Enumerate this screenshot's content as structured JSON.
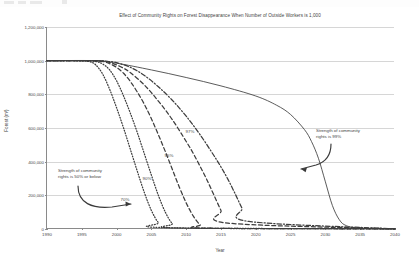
{
  "chart_data": {
    "type": "line",
    "title": "Effect of Community Rights on Forest Disappearance When Number of Outside Workers is 1,000",
    "xlabel": "Year",
    "ylabel": "Forest (m³)",
    "xlim": [
      1990,
      2040
    ],
    "ylim": [
      0,
      1200000
    ],
    "xticks": [
      1990,
      1995,
      2000,
      2005,
      2010,
      2015,
      2020,
      2025,
      2030,
      2035,
      2040
    ],
    "xtick_labels": [
      "1990",
      "1995",
      "2000",
      "2005",
      "2010",
      "2015",
      "2020",
      "2025",
      "2030",
      "2035",
      "2040"
    ],
    "yticks": [
      0,
      200000,
      400000,
      600000,
      800000,
      1000000,
      1200000
    ],
    "ytick_labels": [
      "0",
      "200,000",
      "400,000",
      "600,000",
      "800,000",
      "1,000,000",
      "1,200,000"
    ],
    "grid": true,
    "legend_position": "none",
    "line_color": "#3d3d3d",
    "grid_color": "#d6d6d6",
    "axis_color": "#8a8a8a",
    "series": [
      {
        "name": "50% or below",
        "label": "",
        "style": "dotted",
        "x": [
          1990,
          1994,
          1996,
          1997,
          1998,
          1999,
          2000,
          2001,
          2002,
          2003,
          2004,
          2005,
          2006,
          2007,
          2040
        ],
        "values": [
          1000000,
          1000000,
          995000,
          975000,
          920000,
          830000,
          720000,
          600000,
          470000,
          340000,
          215000,
          110000,
          38000,
          8000,
          1000
        ]
      },
      {
        "name": "70%",
        "label": "70%",
        "style": "dotted",
        "x": [
          1990,
          1995,
          1997,
          1998,
          1999,
          2000,
          2001,
          2002,
          2003,
          2004,
          2005,
          2006,
          2007,
          2008,
          2009,
          2040
        ],
        "values": [
          1000000,
          1000000,
          995000,
          980000,
          945000,
          880000,
          790000,
          685000,
          570000,
          445000,
          320000,
          200000,
          100000,
          32000,
          6000,
          1000
        ]
      },
      {
        "name": "90%",
        "label": "90%",
        "style": "dashed",
        "x": [
          1990,
          1996,
          1998,
          1999,
          2000,
          2001,
          2002,
          2003,
          2004,
          2005,
          2006,
          2007,
          2008,
          2009,
          2010,
          2011,
          2012,
          2013,
          2040
        ],
        "values": [
          1000000,
          1000000,
          995000,
          982000,
          960000,
          925000,
          875000,
          812000,
          740000,
          655000,
          560000,
          460000,
          355000,
          250000,
          155000,
          78000,
          25000,
          5000,
          1000
        ]
      },
      {
        "name": "95%",
        "label": "95%",
        "style": "dashed",
        "x": [
          1990,
          1996,
          1998,
          1999,
          2000,
          2001,
          2002,
          2004,
          2006,
          2008,
          2010,
          2011,
          2012,
          2013,
          2014,
          2015,
          2016,
          2040
        ],
        "values": [
          1000000,
          1000000,
          997000,
          990000,
          975000,
          955000,
          928000,
          855000,
          760000,
          650000,
          520000,
          450000,
          372000,
          290000,
          200000,
          110000,
          35000,
          1000
        ]
      },
      {
        "name": "97%",
        "label": "97%",
        "style": "dashdot",
        "x": [
          1990,
          1997,
          1999,
          2000,
          2002,
          2004,
          2006,
          2008,
          2010,
          2012,
          2014,
          2015,
          2016,
          2017,
          2018,
          2019,
          2040
        ],
        "values": [
          1000000,
          1000000,
          995000,
          988000,
          960000,
          912000,
          845000,
          765000,
          670000,
          560000,
          435000,
          368000,
          295000,
          212000,
          125000,
          45000,
          1000
        ]
      },
      {
        "name": "99%",
        "label": "",
        "style": "solid",
        "x": [
          1990,
          1997,
          2000,
          2005,
          2010,
          2015,
          2020,
          2023,
          2025,
          2027,
          2028,
          2029,
          2030,
          2031,
          2032,
          2033,
          2035,
          2040
        ],
        "values": [
          1000000,
          1000000,
          985000,
          945000,
          900000,
          850000,
          790000,
          735000,
          680000,
          590000,
          520000,
          420000,
          280000,
          140000,
          55000,
          20000,
          5000,
          1000
        ]
      }
    ],
    "series_labels": [
      {
        "text": "97%",
        "x_px": 189,
        "y_px": 131
      },
      {
        "text": "95%",
        "x_px": 168,
        "y_px": 155
      },
      {
        "text": "90%",
        "x_px": 146,
        "y_px": 178
      },
      {
        "text": "70%",
        "x_px": 124,
        "y_px": 199
      }
    ],
    "annotations": [
      {
        "name": "left-annotation",
        "lines": [
          "Strength of community",
          "rights is 50% or below"
        ],
        "x_px": 58,
        "y_px": 168
      },
      {
        "name": "right-annotation",
        "lines": [
          "Strength of community",
          "rights is 99%"
        ],
        "x_px": 316,
        "y_px": 128
      }
    ]
  }
}
